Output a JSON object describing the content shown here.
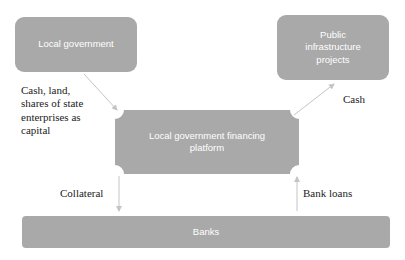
{
  "nodes": {
    "local_government": {
      "label": "Local government"
    },
    "public_infrastructure": {
      "label": "Public infrastructure projects",
      "lines": [
        "Public",
        "infrastructure",
        "projects"
      ]
    },
    "financing_platform": {
      "label": "Local government financing platform",
      "lines": [
        "Local government financing",
        "platform"
      ]
    },
    "banks": {
      "label": "Banks"
    }
  },
  "edges": [
    {
      "from": "local_government",
      "to": "financing_platform",
      "label": "Cash, land, shares of state enterprises as capital"
    },
    {
      "from": "financing_platform",
      "to": "public_infrastructure",
      "label": "Cash"
    },
    {
      "from": "financing_platform",
      "to": "banks",
      "label": "Collateral"
    },
    {
      "from": "banks",
      "to": "financing_platform",
      "label": "Bank loans"
    }
  ],
  "edge_labels": {
    "capital_lines": [
      "Cash, land,",
      "shares of state",
      "enterprises as",
      "capital"
    ],
    "cash": "Cash",
    "collateral": "Collateral",
    "bank_loans": "Bank loans"
  },
  "colors": {
    "box_fill": "#a9a9a9",
    "box_text": "#ffffff",
    "arrow": "#c4c4c4",
    "label_text": "#222222"
  }
}
